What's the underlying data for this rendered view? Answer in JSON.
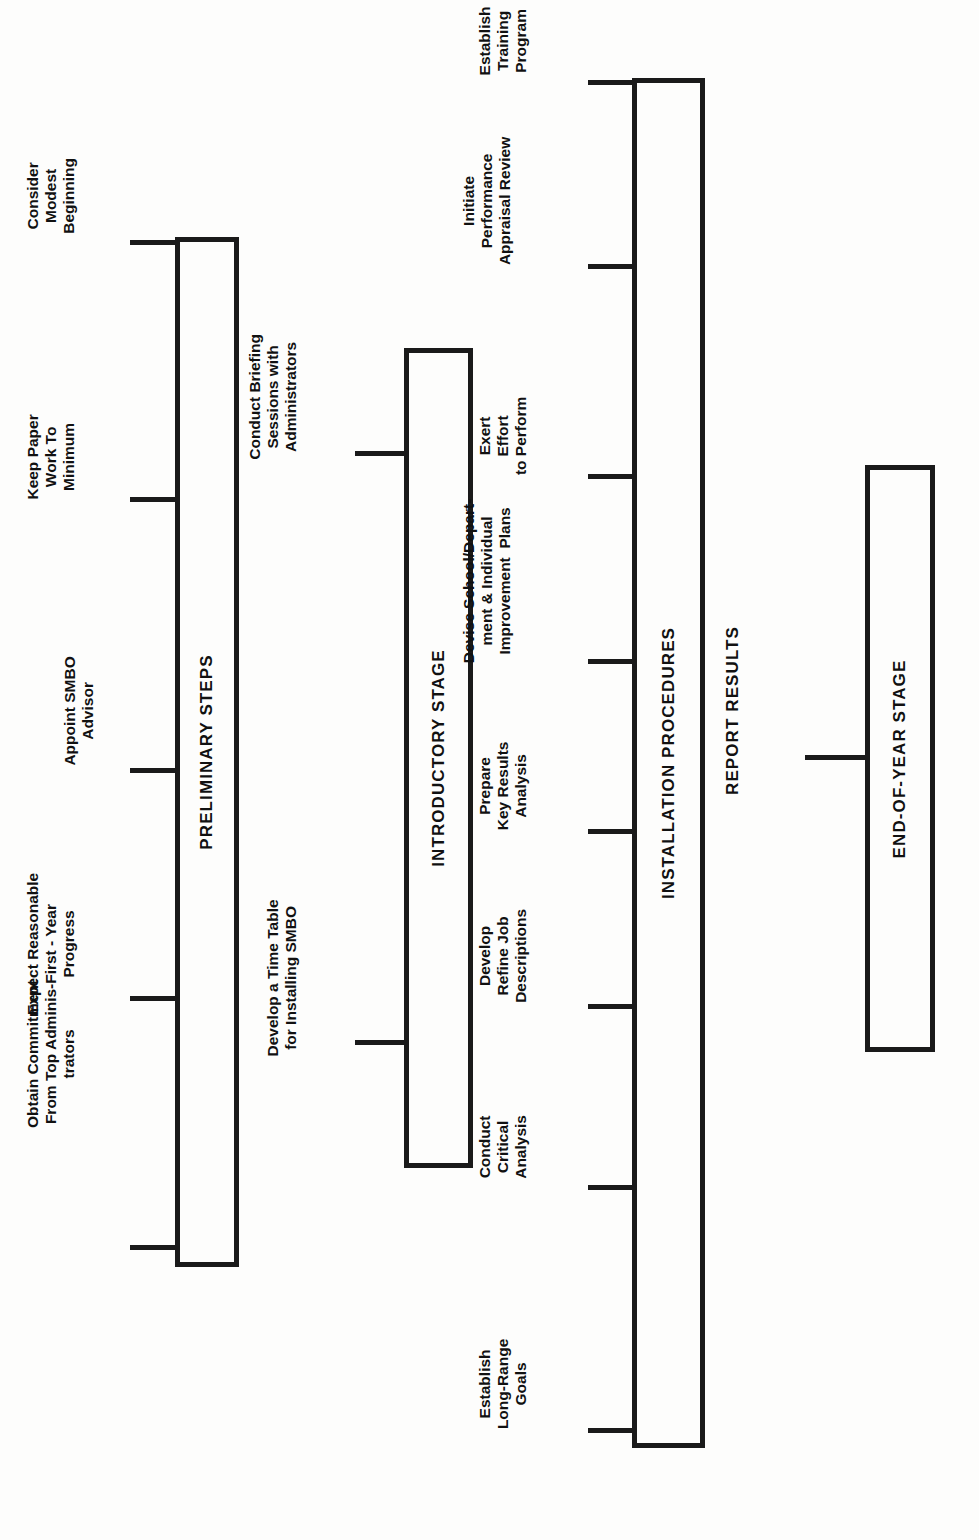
{
  "diagram": {
    "orientation": "rotated-90",
    "stages": [
      {
        "id": "preliminary-steps",
        "label": "PRELIMINARY STEPS",
        "steps": [
          "Obtain Commitment\nFrom Top Adminis-\ntrators",
          "Expect Reasonable\nFirst - Year\nProgress",
          "Appoint SMBO\nAdvisor",
          "Keep Paper\nWork To\nMinimum",
          "Consider\nModest\nBeginning"
        ]
      },
      {
        "id": "introductory-stage",
        "label": "INTRODUCTORY STAGE",
        "steps": [
          "Develop a Time Table\nfor Installing SMBO",
          "Conduct Briefing\nSessions with\nAdministrators"
        ]
      },
      {
        "id": "installation-procedures",
        "label": "INSTALLATION PROCEDURES",
        "steps": [
          "Establish\nLong-Range\nGoals",
          "Conduct\nCritical\nAnalysis",
          "Develop\nRefine Job\nDescriptions",
          "Prepare\nKey Results\nAnalysis",
          "Devise School/Depart-\nment & Individual\nImprovement  Plans",
          "Exert\nEffort\nto Perform",
          "Initiate\nPerformance\nAppraisal Review",
          "Establish\nTraining\nProgram"
        ]
      },
      {
        "id": "end-of-year-stage",
        "label": "END-OF-YEAR STAGE",
        "steps": [
          "REPORT RESULTS"
        ]
      }
    ],
    "free_labels": [
      "REPORT RESULTS"
    ],
    "colors": {
      "ink": "#1a1a1a",
      "paper": "#fdfdfc"
    }
  }
}
